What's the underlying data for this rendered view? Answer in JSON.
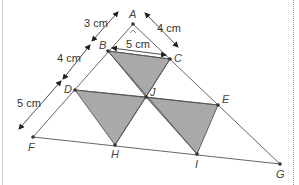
{
  "diagram": {
    "type": "geometry-triangle",
    "points": {
      "A": {
        "label": "A",
        "x": 133,
        "y": 24
      },
      "B": {
        "label": "B",
        "x": 108,
        "y": 51
      },
      "C": {
        "label": "C",
        "x": 170,
        "y": 59
      },
      "D": {
        "label": "D",
        "x": 75,
        "y": 90
      },
      "J": {
        "label": "J",
        "x": 146,
        "y": 97
      },
      "E": {
        "label": "E",
        "x": 218,
        "y": 105
      },
      "F": {
        "label": "F",
        "x": 33,
        "y": 137
      },
      "H": {
        "label": "H",
        "x": 115,
        "y": 145
      },
      "I": {
        "label": "I",
        "x": 197,
        "y": 154
      },
      "G": {
        "label": "G",
        "x": 280,
        "y": 164
      }
    },
    "shaded_triangles": [
      [
        "B",
        "C",
        "J"
      ],
      [
        "D",
        "J",
        "H"
      ],
      [
        "J",
        "E",
        "I"
      ]
    ],
    "dimensions": {
      "AB": "3 cm",
      "BD": "4 cm",
      "DF": "5 cm",
      "AC": "4 cm",
      "BC": "5 cm"
    },
    "colors": {
      "shade": "#a9a9a9",
      "line": "#555555",
      "text": "#444444"
    }
  }
}
